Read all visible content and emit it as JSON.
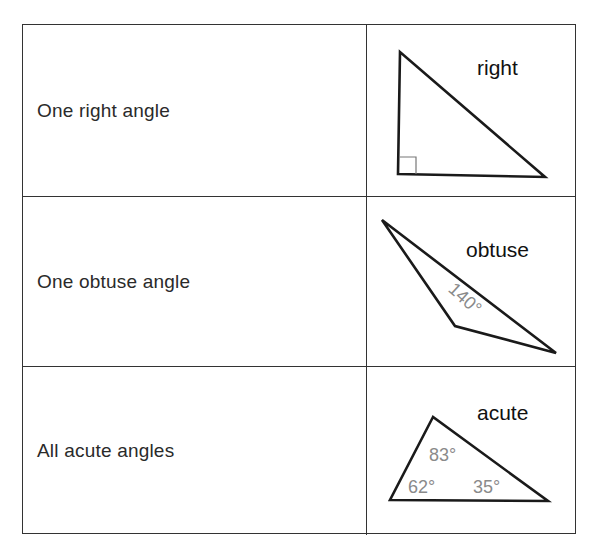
{
  "table": {
    "rows": [
      {
        "description": "One right angle",
        "triangle_type": "right",
        "angle_labels": []
      },
      {
        "description": "One obtuse angle",
        "triangle_type": "obtuse",
        "angle_labels": [
          "140°"
        ]
      },
      {
        "description": "All acute angles",
        "triangle_type": "acute",
        "angle_labels": [
          "83°",
          "62°",
          "35°"
        ]
      }
    ]
  },
  "colors": {
    "border": "#333333",
    "text": "#2a2a2a",
    "triangle_stroke": "#1a1a1a",
    "angle_label": "#8a8a8a",
    "right_angle_mark": "#777777"
  }
}
